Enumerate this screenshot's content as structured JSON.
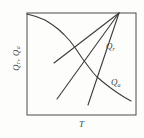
{
  "figure": {
    "background": "#fdfdfc",
    "stroke_color": "#3b3b3b",
    "frame_color": "#4a4a4a",
    "text_color": "#3f3f3f"
  },
  "labels": {
    "x_axis": "T",
    "y_axis": {
      "base1": "Q",
      "sub1": "r",
      "separator": ", ",
      "base2": "Q",
      "sub2": "a"
    },
    "line_family": {
      "base": "Q",
      "sub": "r"
    },
    "curve": {
      "base": "Q",
      "sub": "a"
    }
  },
  "chart_data": {
    "type": "line",
    "title": "",
    "xlabel": "T",
    "ylabel": "Qr, Qa",
    "axes_style": "qualitative sketch; closed box frame; no ticks, no numeric scale, no grid",
    "grid": false,
    "legend": false,
    "plot_area_px": {
      "x": 27,
      "y": 13,
      "width": 109,
      "height": 102
    },
    "series": [
      {
        "name": "Qa-curve",
        "label": "Qa",
        "shape": "curve",
        "points_px": [
          [
            27,
            14
          ],
          [
            36,
            16.5
          ],
          [
            45,
            20
          ],
          [
            52,
            24.5
          ],
          [
            58,
            29
          ],
          [
            64,
            34.5
          ],
          [
            70,
            41
          ],
          [
            76,
            49
          ],
          [
            82,
            58
          ],
          [
            88,
            66
          ],
          [
            93,
            72.5
          ],
          [
            97,
            77
          ],
          [
            103,
            82
          ],
          [
            110,
            87.5
          ],
          [
            117,
            92.5
          ],
          [
            124,
            97
          ],
          [
            131,
            101
          ]
        ]
      },
      {
        "name": "Qr-line-steep",
        "label": "Qr",
        "shape": "straight",
        "points_px": [
          [
            119,
            13
          ],
          [
            88,
            105
          ]
        ]
      },
      {
        "name": "Qr-line-middle",
        "label": "Qr",
        "shape": "straight",
        "points_px": [
          [
            119,
            13
          ],
          [
            57,
            99
          ]
        ]
      },
      {
        "name": "Qr-line-shallow",
        "label": "Qr",
        "shape": "straight",
        "points_px": [
          [
            119,
            13
          ],
          [
            54,
            63
          ]
        ]
      }
    ],
    "annotations": [
      {
        "text": "Qr",
        "x_px": 107,
        "y_px": 43
      },
      {
        "text": "Qa",
        "x_px": 112,
        "y_px": 79
      }
    ]
  }
}
